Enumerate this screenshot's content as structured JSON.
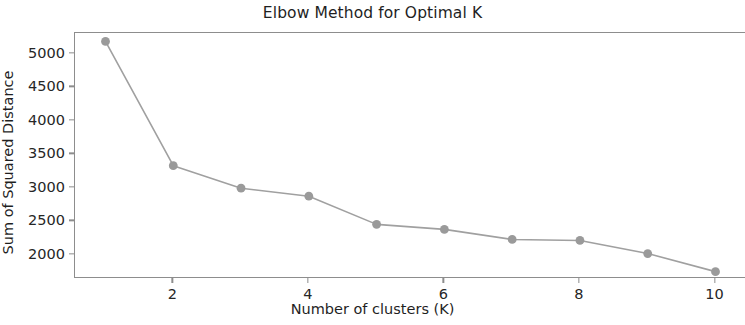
{
  "chart_data": {
    "type": "line",
    "title": "Elbow Method for Optimal K",
    "xlabel": "Number of clusters (K)",
    "ylabel": "Sum of Squared Distance",
    "x": [
      1,
      2,
      3,
      4,
      5,
      6,
      7,
      8,
      9,
      10
    ],
    "values": [
      5185,
      3330,
      2995,
      2875,
      2455,
      2380,
      2230,
      2215,
      2020,
      1750
    ],
    "series": [
      {
        "name": "Sum of Squared Distance",
        "values": [
          5185,
          3330,
          2995,
          2875,
          2455,
          2380,
          2230,
          2215,
          2020,
          1750
        ]
      }
    ],
    "xticks": [
      2,
      4,
      6,
      8,
      10
    ],
    "xtick_labels": [
      "2",
      "4",
      "6",
      "8",
      "10"
    ],
    "yticks": [
      2000,
      2500,
      3000,
      3500,
      4000,
      4500,
      5000
    ],
    "ytick_labels": [
      "2000",
      "2500",
      "3000",
      "3500",
      "4000",
      "4500",
      "5000"
    ],
    "xlim": [
      0.55,
      10.45
    ],
    "ylim": [
      1640,
      5310
    ],
    "grid": false,
    "legend": false,
    "line_color": "#a0a0a0",
    "marker_color": "#9a9a9a",
    "marker": "circle",
    "axis_color": "#8d8d8d",
    "background": "#ffffff"
  }
}
